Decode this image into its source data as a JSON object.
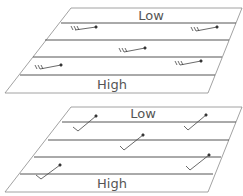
{
  "diagrams": [
    {
      "name": "upper-panel",
      "top_label": "Low",
      "bottom_label": "High",
      "barb_style": "horizontal-west"
    },
    {
      "name": "lower-panel",
      "top_label": "Low",
      "bottom_label": "High",
      "barb_style": "diagonal-southwest"
    }
  ],
  "colors": {
    "outline": "#888888",
    "band_line": "#555555",
    "barb": "#333333",
    "label": "#555555"
  }
}
